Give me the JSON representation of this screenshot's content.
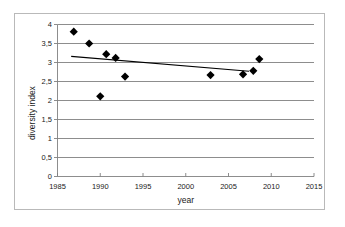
{
  "chart_data": {
    "type": "scatter",
    "title": "",
    "xlabel": "year",
    "ylabel": "diversity index",
    "xlim": [
      1985,
      2015
    ],
    "ylim": [
      0,
      4
    ],
    "grid": "horizontal",
    "legend": "none",
    "x_ticks": [
      "1985",
      "1990",
      "1995",
      "2000",
      "2005",
      "2010",
      "2015"
    ],
    "x_tick_values": [
      1985,
      1990,
      1995,
      2000,
      2005,
      2010,
      2015
    ],
    "y_ticks": [
      "0",
      "0,5",
      "1",
      "1,5",
      "2",
      "2,5",
      "3",
      "3,5",
      "4"
    ],
    "y_tick_values": [
      0,
      0.5,
      1,
      1.5,
      2,
      2.5,
      3,
      3.5,
      4
    ],
    "marker": "diamond",
    "marker_color": "#000000",
    "points": [
      {
        "x": 1986.9,
        "y": 3.81
      },
      {
        "x": 1988.7,
        "y": 3.5
      },
      {
        "x": 1990.0,
        "y": 2.11
      },
      {
        "x": 1990.7,
        "y": 3.22
      },
      {
        "x": 1991.8,
        "y": 3.12
      },
      {
        "x": 1992.9,
        "y": 2.63
      },
      {
        "x": 2002.9,
        "y": 2.67
      },
      {
        "x": 2006.7,
        "y": 2.69
      },
      {
        "x": 2007.9,
        "y": 2.78
      },
      {
        "x": 2008.6,
        "y": 3.09
      }
    ],
    "trendline": {
      "type": "linear",
      "color": "#000000",
      "x_start": 1986.6,
      "y_start": 3.16,
      "x_end": 2007.4,
      "y_end": 2.77
    }
  }
}
